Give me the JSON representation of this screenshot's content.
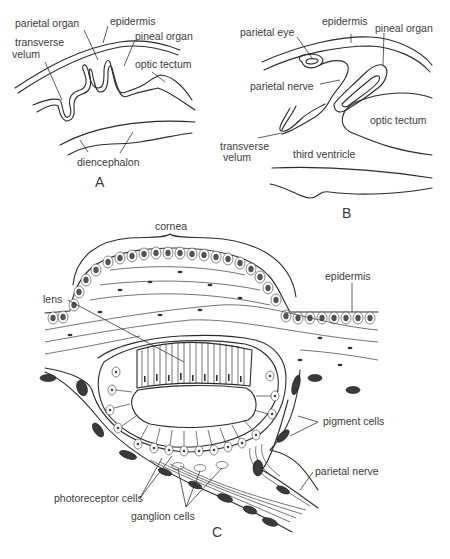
{
  "figure": {
    "panels": [
      {
        "id": "A",
        "letter": "A",
        "labels": {
          "parietal_organ": "parietal organ",
          "epidermis": "epidermis",
          "pineal_organ": "pineal organ",
          "transverse_velum_1": "transverse",
          "transverse_velum_2": "velum",
          "optic_tectum": "optic tectum",
          "diencephalon": "diencephalon"
        }
      },
      {
        "id": "B",
        "letter": "B",
        "labels": {
          "parietal_eye": "parietal eye",
          "epidermis": "epidermis",
          "pineal_organ": "pineal organ",
          "parietal_nerve": "parietal nerve",
          "optic_tectum": "optic tectum",
          "transverse_velum_1": "transverse",
          "transverse_velum_2": "velum",
          "third_ventricle": "third ventricle"
        }
      },
      {
        "id": "C",
        "letter": "C",
        "labels": {
          "cornea": "cornea",
          "epidermis": "epidermis",
          "lens": "lens",
          "pigment_cells": "pigment cells",
          "parietal_nerve": "parietal nerve",
          "photoreceptor_cells": "photoreceptor cells",
          "ganglion_cells": "ganglion cells"
        }
      }
    ],
    "colors": {
      "ink": "#2a2a2a",
      "label": "#3a3a3a",
      "background": "#ffffff"
    }
  }
}
